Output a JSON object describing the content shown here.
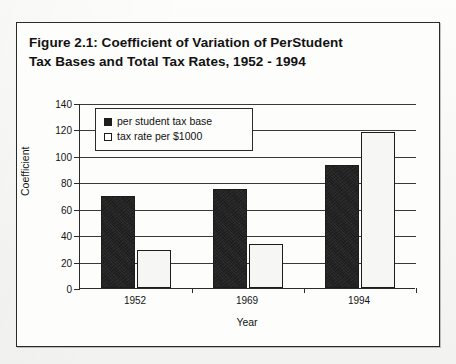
{
  "page": {
    "scan_fragment": "a. nearving data 1952"
  },
  "figure": {
    "title_line1": "Figure 2.1: Coefficient of Variation of PerStudent",
    "title_line2": "Tax Bases and Total Tax Rates, 1952 - 1994"
  },
  "legend": {
    "items": [
      {
        "label": "per student tax base",
        "swatch": "black-square-icon",
        "color": "#1d1d1d"
      },
      {
        "label": "tax rate per $1000",
        "swatch": "white-square-icon",
        "color": "#ffffff"
      }
    ]
  },
  "chart_data": {
    "type": "bar",
    "title": "Figure 2.1: Coefficient of Variation of PerStudent Tax Bases and Total Tax Rates, 1952 - 1994",
    "xlabel": "Year",
    "ylabel": "Coefficient",
    "categories": [
      "1952",
      "1969",
      "1994"
    ],
    "series": [
      {
        "name": "per student tax base",
        "values": [
          70,
          75,
          93
        ],
        "color": "#1d1d1d"
      },
      {
        "name": "tax rate per $1000",
        "values": [
          29,
          33,
          118
        ],
        "color": "#ffffff"
      }
    ],
    "ylim": [
      0,
      140
    ],
    "ytick_step": 20,
    "yticks": [
      0,
      20,
      40,
      60,
      80,
      100,
      120,
      140
    ],
    "grid": true,
    "legend_position": "upper-left-inside"
  }
}
